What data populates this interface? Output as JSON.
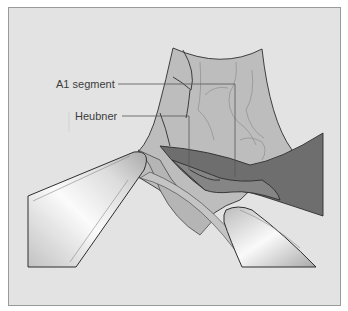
{
  "figure": {
    "type": "surgical illustration",
    "labels": [
      {
        "id": "a1",
        "text": "A1 segment"
      },
      {
        "id": "heubner",
        "text": "Heubner"
      }
    ],
    "colors": {
      "background": "#e3e3e3",
      "frame_border": "#9a9a9a",
      "membrane": "#bdbdbd",
      "membrane_light": "#c9c9c9",
      "vessel_dark": "#6e6e6e",
      "vessel_mid": "#858585",
      "outline": "#2e2e2e",
      "leader_line": "#555555",
      "instrument_highlight": "#fafafa",
      "instrument_shade": "#b5b5b5"
    }
  }
}
